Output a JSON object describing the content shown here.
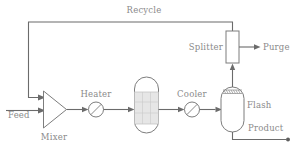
{
  "diagram": {
    "canvas": {
      "width": 299,
      "height": 146,
      "background": "#ffffff"
    },
    "colors": {
      "line": "#6b6b6b",
      "shape_stroke": "#7d7d7d",
      "shape_fill": "#ffffff",
      "bed_fill": "#e6e6e6",
      "label_text": "#8a8a8a"
    },
    "stream_labels": {
      "feed": "Feed",
      "recycle": "Recycle",
      "purge": "Purge",
      "product": "Product"
    },
    "unit_labels": {
      "mixer": "Mixer",
      "heater": "Heater",
      "reactor": "",
      "cooler": "Cooler",
      "flash": "Flash",
      "splitter": "Splitter"
    },
    "units": [
      {
        "id": "mixer",
        "name": "Mixer",
        "type": "triangle-mixer"
      },
      {
        "id": "heater",
        "name": "Heater",
        "type": "circle-exchanger"
      },
      {
        "id": "reactor",
        "name": "",
        "type": "packed-bed-vessel"
      },
      {
        "id": "cooler",
        "name": "Cooler",
        "type": "circle-exchanger"
      },
      {
        "id": "flash",
        "name": "Flash",
        "type": "vertical-drum"
      },
      {
        "id": "splitter",
        "name": "Splitter",
        "type": "rectangle-splitter"
      }
    ],
    "streams": [
      {
        "id": "feed",
        "name": "Feed",
        "from": "boundary",
        "to": "mixer"
      },
      {
        "id": "mixer-out",
        "name": "",
        "from": "mixer",
        "to": "heater"
      },
      {
        "id": "heater-out",
        "name": "",
        "from": "heater",
        "to": "reactor"
      },
      {
        "id": "reactor-out",
        "name": "",
        "from": "reactor",
        "to": "cooler"
      },
      {
        "id": "cooler-out",
        "name": "",
        "from": "cooler",
        "to": "flash"
      },
      {
        "id": "flash-vapor",
        "name": "",
        "from": "flash",
        "to": "splitter"
      },
      {
        "id": "purge",
        "name": "Purge",
        "from": "splitter",
        "to": "boundary"
      },
      {
        "id": "recycle",
        "name": "Recycle",
        "from": "splitter",
        "to": "mixer"
      },
      {
        "id": "product",
        "name": "Product",
        "from": "flash",
        "to": "boundary"
      }
    ]
  }
}
